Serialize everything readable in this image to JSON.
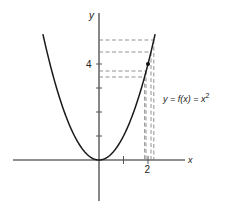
{
  "diagram": {
    "axes": {
      "x_label": "x",
      "y_label": "y",
      "x_tick_labels": [
        "2"
      ],
      "y_tick_labels": [
        "4"
      ]
    },
    "curve_label": {
      "prefix": "y = f(x) = x",
      "exponent": "2"
    },
    "marked_point": {
      "x": 2,
      "y": 4
    },
    "dashed_levels_y": [
      5.0,
      4.5,
      3.7,
      3.46
    ],
    "dashed_levels_x": [
      2.24,
      2.12,
      1.92,
      1.86
    ]
  }
}
